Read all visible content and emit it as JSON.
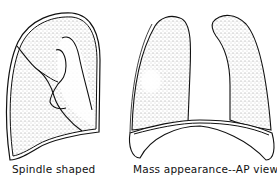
{
  "figure": {
    "panels": [
      {
        "id": "left",
        "caption": "Spindle shaped",
        "subject": "single lung with fissure lines and spindle-shaped opacity"
      },
      {
        "id": "right",
        "caption": "Mass appearance--AP view",
        "subject": "pair of lungs, AP view, with round mass in right field"
      }
    ],
    "colors": {
      "outline": "#111111",
      "stipple": "#9a9a9a",
      "background": "#ffffff"
    }
  }
}
